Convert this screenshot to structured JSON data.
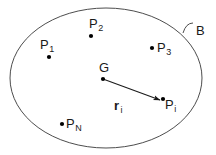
{
  "figure": {
    "type": "diagram",
    "width": 216,
    "height": 155,
    "background_color": "#ffffff",
    "stroke_color": "#4d4d4d",
    "text_color": "#1a1a1a",
    "point_color": "#000000"
  },
  "boundary": {
    "name": "body-boundary",
    "shape": "ellipse",
    "center": [
      106,
      78
    ],
    "radius_x": 96,
    "radius_y": 70,
    "label": "B",
    "label_position": [
      196,
      24
    ],
    "leader": {
      "name": "leader-arc",
      "path": "M 183 33 Q 186 23 193 23"
    }
  },
  "points": [
    {
      "name": "point-p1",
      "label": "P",
      "subscript": "1",
      "dot": [
        49,
        57
      ],
      "label_position": [
        40,
        38
      ]
    },
    {
      "name": "point-p2",
      "label": "P",
      "subscript": "2",
      "dot": [
        91,
        36
      ],
      "label_position": [
        89,
        17
      ]
    },
    {
      "name": "point-p3",
      "label": "P",
      "subscript": "3",
      "dot": [
        152,
        48
      ],
      "label_position": [
        157,
        41
      ]
    },
    {
      "name": "point-pi",
      "label": "P",
      "subscript": "i",
      "dot": [
        163,
        99
      ],
      "label_position": [
        165,
        98
      ]
    },
    {
      "name": "point-pn",
      "label": "P",
      "subscript": "N",
      "dot": [
        62,
        124
      ],
      "label_position": [
        66,
        117
      ]
    }
  ],
  "centroid": {
    "name": "point-g",
    "label": "G",
    "dot": [
      103,
      79
    ],
    "label_position": [
      99,
      61
    ]
  },
  "vector": {
    "name": "position-vector-ri",
    "label": "r",
    "subscript": "i",
    "label_position": [
      114,
      99
    ],
    "from": [
      103,
      79
    ],
    "to": [
      160,
      100
    ],
    "arrowhead": true,
    "bold": true
  }
}
